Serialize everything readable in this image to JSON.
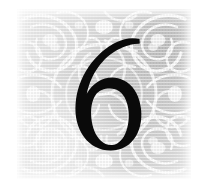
{
  "page": {
    "background_color": "#ffffff",
    "width": 204,
    "height": 191
  },
  "ornament_panel": {
    "label": "decorative arabesque halftone panel",
    "base_color": "#d5d5d5",
    "light_color": "#f2f2f2",
    "dark_color": "#c2c2c2",
    "ornament_color": "#ffffff",
    "print_style": "halftone dot screen",
    "bounds": {
      "left": 17,
      "top": 9,
      "width": 174,
      "height": 170
    }
  },
  "chapter": {
    "number": "6",
    "numeral_color": "#0a0a0a",
    "typeface_style": "serif old-style figure"
  }
}
